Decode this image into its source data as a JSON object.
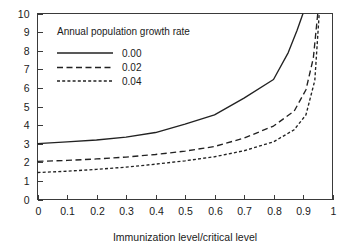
{
  "chart_data": {
    "type": "line",
    "title": "",
    "xlabel": "Immunization level/critical level",
    "ylabel": "",
    "xlim": [
      0,
      1
    ],
    "ylim": [
      0,
      10
    ],
    "grid": false,
    "legend_position": "upper-left-inside",
    "legend_title": "Annual population growth rate",
    "xticks": [
      "0",
      "0.1",
      "0.2",
      "0.3",
      "0.4",
      "0.5",
      "0.6",
      "0.7",
      "0.8",
      "0.9",
      "1"
    ],
    "xtick_values": [
      0,
      0.1,
      0.2,
      0.3,
      0.4,
      0.5,
      0.6,
      0.7,
      0.8,
      0.9,
      1.0
    ],
    "yticks": [
      "0",
      "1",
      "2",
      "3",
      "4",
      "5",
      "6",
      "7",
      "8",
      "9",
      "10"
    ],
    "ytick_values": [
      0,
      1,
      2,
      3,
      4,
      5,
      6,
      7,
      8,
      9,
      10
    ],
    "series": [
      {
        "name": "0.00",
        "style": "solid",
        "color": "#222222",
        "x": [
          0.0,
          0.1,
          0.2,
          0.3,
          0.4,
          0.5,
          0.6,
          0.7,
          0.8,
          0.85,
          0.88,
          0.9
        ],
        "values": [
          3.0,
          3.1,
          3.2,
          3.35,
          3.6,
          4.05,
          4.55,
          5.45,
          6.45,
          7.9,
          9.1,
          10.0
        ]
      },
      {
        "name": "0.02",
        "style": "dashed",
        "color": "#222222",
        "x": [
          0.0,
          0.1,
          0.2,
          0.3,
          0.4,
          0.5,
          0.6,
          0.7,
          0.8,
          0.87,
          0.91,
          0.935,
          0.95
        ],
        "values": [
          2.05,
          2.1,
          2.18,
          2.28,
          2.42,
          2.6,
          2.85,
          3.3,
          3.95,
          4.75,
          5.9,
          7.6,
          10.0
        ]
      },
      {
        "name": "0.04",
        "style": "fine-dashed",
        "color": "#222222",
        "x": [
          0.0,
          0.1,
          0.2,
          0.3,
          0.4,
          0.5,
          0.6,
          0.7,
          0.8,
          0.87,
          0.91,
          0.94,
          0.955
        ],
        "values": [
          1.45,
          1.52,
          1.62,
          1.74,
          1.9,
          2.08,
          2.3,
          2.62,
          3.1,
          3.75,
          4.55,
          6.4,
          10.0
        ]
      }
    ]
  }
}
